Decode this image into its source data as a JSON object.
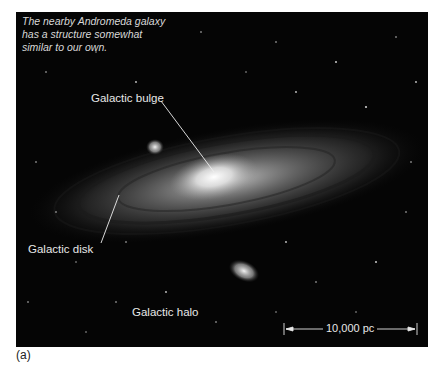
{
  "figure": {
    "caption": "The nearby Andromeda galaxy has a structure somewhat similar to our own.",
    "caption_lines": [
      "The nearby Andromeda galaxy",
      "has a structure somewhat",
      "similar to our own."
    ],
    "labels": {
      "bulge": "Galactic bulge",
      "disk": "Galactic disk",
      "halo": "Galactic halo"
    },
    "scale_bar": "10,000 pc",
    "panel_label": "(a)"
  }
}
